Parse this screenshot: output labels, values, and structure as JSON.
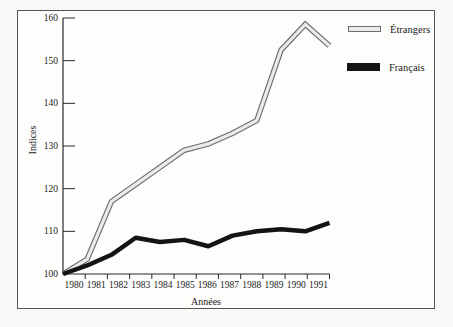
{
  "chart_data": {
    "type": "line",
    "title": "",
    "xlabel": "Années",
    "ylabel": "Indices",
    "x": [
      1980,
      1981,
      1982,
      1983,
      1984,
      1985,
      1986,
      1987,
      1988,
      1989,
      1990,
      1991
    ],
    "series": [
      {
        "name": "Étrangers",
        "style": "outlined-light-ribbon",
        "values": [
          100,
          103.5,
          117,
          121,
          125,
          129,
          130.5,
          133,
          136,
          152.5,
          158.5,
          153.5
        ]
      },
      {
        "name": "Français",
        "style": "solid-black-thick",
        "values": [
          100,
          102,
          104.5,
          108.5,
          107.5,
          108,
          106.5,
          109,
          110,
          110.5,
          110,
          112
        ]
      }
    ],
    "ylim": [
      100,
      160
    ],
    "yticks": [
      100,
      110,
      120,
      130,
      140,
      150,
      160
    ],
    "grid": false,
    "legend_position": "top-right"
  },
  "colors": {
    "etrangers_fill": "#ebebeb",
    "etrangers_outline": "#6f6f6f",
    "francais": "#141414",
    "axis": "#2a2a2a",
    "tick_text": "#1c1c1c",
    "border": "#565656",
    "outer_background": "#f8f8f6",
    "inner_background": "#fdfdfc"
  }
}
